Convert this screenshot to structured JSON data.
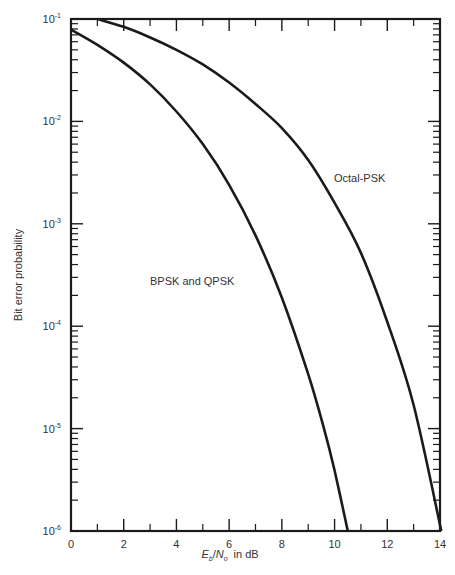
{
  "chart_data": {
    "type": "line",
    "title": "",
    "xlabel": "Eb/N0 in dB",
    "xlabel_parts": {
      "E": "E",
      "b": "b",
      "slash": "/",
      "N": "N",
      "o": "o",
      "suffix": "in dB"
    },
    "ylabel": "Bit error probability",
    "xlim": [
      0,
      14
    ],
    "ylim": [
      1e-06,
      0.1
    ],
    "yscale": "log",
    "grid": false,
    "x_ticks": [
      0,
      2,
      4,
      6,
      8,
      10,
      12,
      14
    ],
    "x_minor_ticks": [
      1,
      3,
      5,
      7,
      9,
      11,
      13
    ],
    "y_ticks": [
      {
        "exp": -1,
        "label": "10",
        "sup": "-1"
      },
      {
        "exp": -2,
        "label": "10",
        "sup": "-2"
      },
      {
        "exp": -3,
        "label": "10",
        "sup": "-3"
      },
      {
        "exp": -4,
        "label": "10",
        "sup": "-4"
      },
      {
        "exp": -5,
        "label": "10",
        "sup": "-5"
      },
      {
        "exp": -6,
        "label": "10",
        "sup": "-6"
      }
    ],
    "series": [
      {
        "name": "BPSK and QPSK",
        "label_pos": {
          "x": 150,
          "y": 285
        },
        "x": [
          0,
          1,
          2,
          3,
          4,
          5,
          6,
          7,
          8,
          9,
          9.6,
          10,
          10.5
        ],
        "values": [
          0.079,
          0.056,
          0.0375,
          0.023,
          0.0125,
          0.006,
          0.0024,
          0.00077,
          0.00019,
          3.4e-05,
          1e-05,
          3.9e-06,
          1e-06
        ]
      },
      {
        "name": "Octal-PSK",
        "label_pos": {
          "x": 334,
          "y": 182
        },
        "x": [
          1,
          2,
          3,
          4,
          5,
          6,
          7,
          8,
          9,
          10,
          11,
          12,
          13,
          14.05
        ],
        "values": [
          0.1,
          0.084,
          0.066,
          0.05,
          0.036,
          0.024,
          0.0148,
          0.0086,
          0.0042,
          0.0016,
          0.00052,
          0.00011,
          1.7e-05,
          1e-06
        ]
      }
    ]
  }
}
